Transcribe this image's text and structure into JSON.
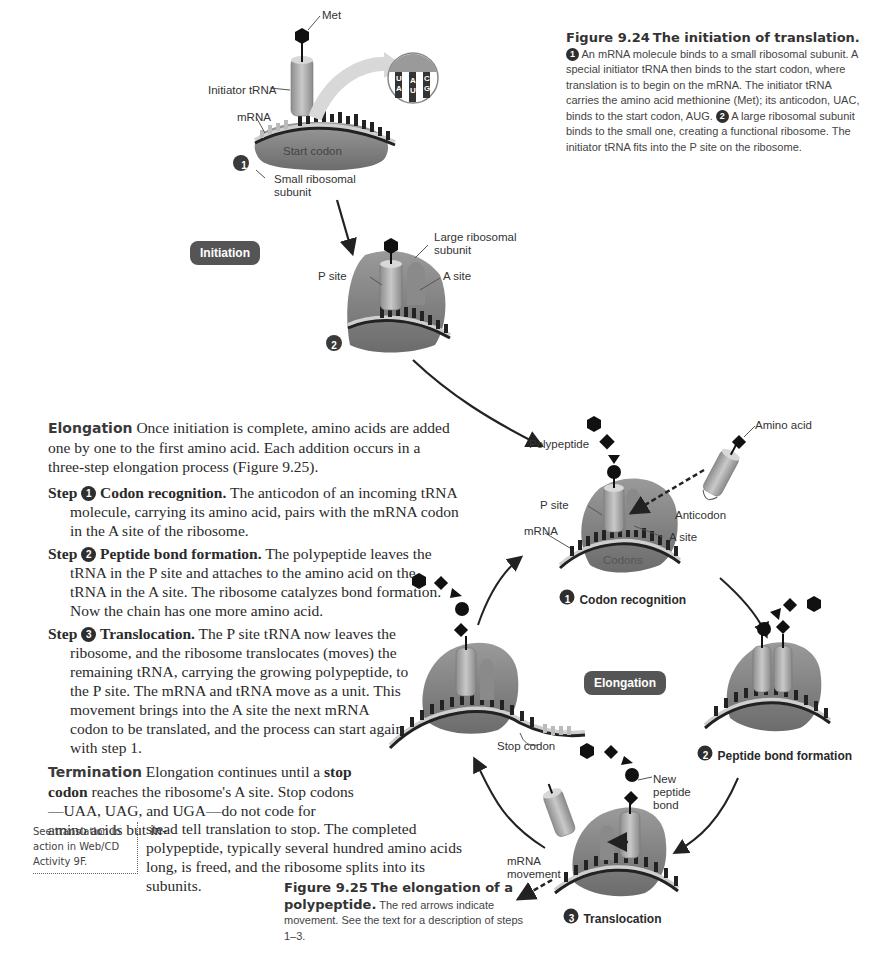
{
  "figure_9_24": {
    "title_number": "Figure 9.24",
    "title_text": "The initiation of translation.",
    "caption_step1": "An mRNA molecule binds to a small ribosomal subunit. A special initiator tRNA then binds to the start codon, where translation is to begin on the mRNA. The initiator tRNA carries the amino acid methionine (Met); its anticodon, UAC, binds to the start codon, AUG.",
    "caption_step2": "A large ribosomal subunit binds to the small one, creating a functional ribosome. The initiator tRNA fits into the P site on the ribosome.",
    "step1_num": "1",
    "step2_num": "2",
    "labels": {
      "met": "Met",
      "initiator_trna": "Initiator tRNA",
      "mrna": "mRNA",
      "start_codon": "Start codon",
      "small_subunit": "Small ribosomal subunit",
      "large_subunit": "Large ribosomal subunit",
      "p_site": "P site",
      "a_site": "A site"
    },
    "inset_bases": {
      "anticodon": [
        "U",
        "A",
        "C"
      ],
      "codon": [
        "A",
        "U",
        "G"
      ]
    },
    "stage_badge": "Initiation"
  },
  "text": {
    "elongation_head": "Elongation",
    "elongation_body": "Once initiation is complete, amino acids are added one by one to the first amino acid. Each addition occurs in a three-step elongation process (Figure 9.25).",
    "steps": [
      {
        "prefix": "Step",
        "num": "1",
        "title": "Codon recognition.",
        "body": "The anticodon of an incoming tRNA molecule, carrying its amino acid, pairs with the mRNA codon in the A site of the ribosome."
      },
      {
        "prefix": "Step",
        "num": "2",
        "title": "Peptide bond formation.",
        "body": "The polypeptide leaves the tRNA in the P site and attaches to the amino acid on the tRNA in the A site. The ribosome catalyzes bond formation. Now the chain has one more amino acid."
      },
      {
        "prefix": "Step",
        "num": "3",
        "title": "Translocation.",
        "body": "The P site tRNA now leaves the ribosome, and the ribosome translocates (moves) the remaining tRNA, carrying the growing polypeptide, to the P site. The mRNA and tRNA move as a unit. This movement brings into the A site the next mRNA codon to be translated, and the process can start again with step 1."
      }
    ],
    "termination_head": "Termination",
    "termination_pre": "Elongation continues until a",
    "termination_bold": "stop codon",
    "termination_post1": "reaches the ribosome's A site. Stop codons—UAA, UAG, and UGA—do not code for amino acids but in-",
    "termination_post2": "stead tell translation to stop. The completed polypeptide, typically several hundred amino acids long, is freed, and the ribosome splits into its subunits.",
    "sidebox": "See translation in action in Web/CD Activity 9F."
  },
  "figure_9_25": {
    "title_number": "Figure 9.25",
    "title_text": "The elongation of a polypeptide.",
    "caption": "The red arrows indicate movement. See the text for a description of steps 1–3.",
    "stage_badge": "Elongation",
    "labels": {
      "polypeptide": "Polypeptide",
      "amino_acid": "Amino acid",
      "p_site": "P site",
      "mrna": "mRNA",
      "anticodon": "Anticodon",
      "a_site": "A site",
      "codons": "Codons",
      "stop_codon": "Stop codon",
      "new_peptide_bond": "New peptide bond",
      "mrna_movement": "mRNA movement"
    },
    "stages": [
      {
        "num": "1",
        "label": "Codon recognition"
      },
      {
        "num": "2",
        "label": "Peptide bond formation"
      },
      {
        "num": "3",
        "label": "Translocation"
      }
    ]
  }
}
